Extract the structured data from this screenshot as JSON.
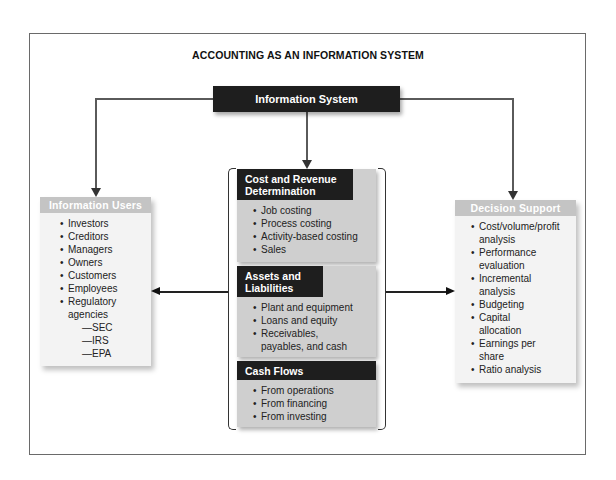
{
  "title": "ACCOUNTING AS AN INFORMATION SYSTEM",
  "information_system": {
    "label": "Information System"
  },
  "information_users": {
    "header": "Information Users",
    "items": [
      "Investors",
      "Creditors",
      "Managers",
      "Owners",
      "Customers",
      "Employees",
      "Regulatory agencies"
    ],
    "sub_items": [
      "—SEC",
      "—IRS",
      "—EPA"
    ]
  },
  "decision_support": {
    "header": "Decision Support",
    "items": [
      "Cost/volume/profit analysis",
      "Performance evaluation",
      "Incremental analysis",
      "Budgeting",
      "Capital allocation",
      "Earnings per share",
      "Ratio analysis"
    ]
  },
  "panels": [
    {
      "header": "Cost and Revenue Determination",
      "items": [
        "Job costing",
        "Process costing",
        "Activity-based costing",
        "Sales"
      ]
    },
    {
      "header": "Assets and Liabilities",
      "items": [
        "Plant and equipment",
        "Loans and equity",
        "Receivables, payables, and cash"
      ]
    },
    {
      "header": "Cash Flows",
      "items": [
        "From operations",
        "From financing",
        "From investing"
      ]
    }
  ],
  "colors": {
    "dark_header": "#1e1e1e",
    "side_header": "#c4c4c4",
    "panel_body": "#cfcfcf",
    "side_body": "#f3f3f3"
  }
}
